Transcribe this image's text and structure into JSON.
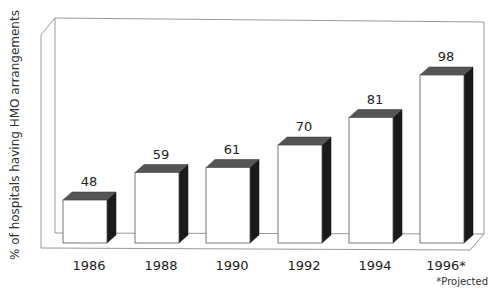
{
  "chart_data": {
    "type": "bar",
    "title": "",
    "xlabel": "",
    "ylabel": "% of hospitals having HMO arrangements",
    "categories": [
      "1986",
      "1988",
      "1990",
      "1992",
      "1994",
      "1996*"
    ],
    "values": [
      48,
      59,
      61,
      70,
      81,
      98
    ],
    "ylim": [
      0,
      100
    ],
    "grid": false,
    "legend": null,
    "style": "3d-bar",
    "annotations": [
      "*Projected"
    ]
  },
  "labels": {
    "ylabel": "% of hospitals having HMO arrangements",
    "footnote": "*Projected",
    "values": [
      "48",
      "59",
      "61",
      "70",
      "81",
      "98"
    ],
    "categories": [
      "1986",
      "1988",
      "1990",
      "1992",
      "1994",
      "1996*"
    ]
  },
  "colors": {
    "bar_front": "#ffffff",
    "bar_top": "#555555",
    "bar_side": "#1a1a1a",
    "frame": "#888888"
  }
}
